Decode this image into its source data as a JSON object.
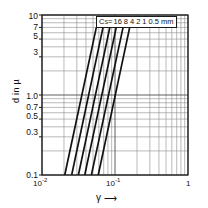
{
  "figure": {
    "background_color": "#ffffff",
    "line_color": "#111111",
    "grid_color": "#8c8c8c",
    "frame_color": "#1a1a1a"
  },
  "axes": {
    "y": {
      "title": "d in µ",
      "tick_labels": [
        "10",
        "7",
        "5",
        "3",
        "1.0",
        "0.7",
        "0.5",
        "0.3",
        "0.1"
      ],
      "min": 0.1,
      "max": 10
    },
    "x": {
      "title_symbol": "γ",
      "title_arrow": "⟶",
      "tick_labels": [
        "10",
        "10",
        "1"
      ],
      "tick_exponents": [
        "-2",
        "-1",
        ""
      ],
      "min": 0.01,
      "max": 1
    }
  },
  "legend": {
    "prefix": "C",
    "subscript": "S",
    "equals": " =",
    "values": [
      "16",
      "8",
      "4",
      "2",
      "1",
      "0.5"
    ],
    "unit": "mm",
    "full_text": "Cₛ =16 8 4 2 1 0.5 mm"
  },
  "chart_data": {
    "type": "line",
    "title": "",
    "xlabel": "γ",
    "ylabel": "d in µ",
    "xscale": "log",
    "yscale": "log",
    "xlim": [
      0.01,
      1
    ],
    "ylim": [
      0.1,
      10
    ],
    "grid": true,
    "legend_position": "top-center-inside",
    "legend_title": "C_S (mm)",
    "x_tick_labels": [
      "10^-2",
      "10^-1",
      "1"
    ],
    "y_tick_labels": [
      "10",
      "7",
      "5",
      "3",
      "1.0",
      "0.7",
      "0.5",
      "0.3",
      "0.1"
    ],
    "series": [
      {
        "name": "16 mm",
        "x": [
          0.0205,
          0.0555
        ],
        "y": [
          0.1,
          7.0
        ]
      },
      {
        "name": "8 mm",
        "x": [
          0.0255,
          0.0685
        ],
        "y": [
          0.1,
          7.0
        ]
      },
      {
        "name": "4 mm",
        "x": [
          0.0315,
          0.085
        ],
        "y": [
          0.1,
          7.0
        ]
      },
      {
        "name": "2 mm",
        "x": [
          0.0385,
          0.104
        ],
        "y": [
          0.1,
          7.0
        ]
      },
      {
        "name": "1 mm",
        "x": [
          0.0475,
          0.129
        ],
        "y": [
          0.1,
          7.0
        ]
      },
      {
        "name": "0.5 mm",
        "x": [
          0.059,
          0.159
        ],
        "y": [
          0.1,
          7.0
        ]
      }
    ]
  }
}
